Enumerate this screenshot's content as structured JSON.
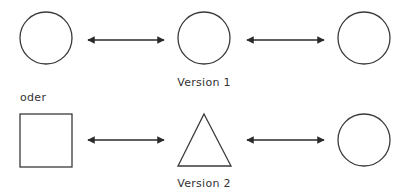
{
  "labels": {
    "version1": "Version 1",
    "oder": "oder",
    "version2": "Version 2"
  },
  "colors": {
    "stroke": "#3a3a3a",
    "background": "#ffffff"
  },
  "rows": [
    {
      "name": "version-1",
      "shapes": [
        "circle",
        "circle",
        "circle"
      ],
      "connectors": [
        "double-arrow",
        "double-arrow"
      ]
    },
    {
      "name": "version-2",
      "shapes": [
        "square",
        "triangle",
        "circle"
      ],
      "connectors": [
        "double-arrow",
        "double-arrow"
      ]
    }
  ]
}
